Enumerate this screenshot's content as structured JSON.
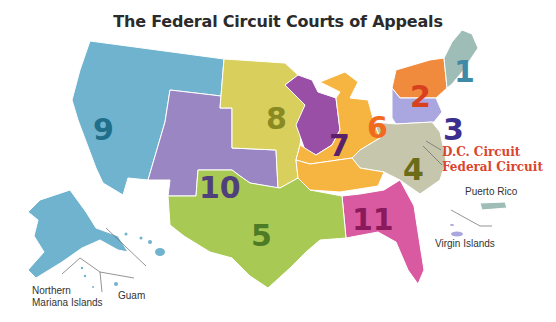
{
  "title": "The Federal Circuit Courts of Appeals",
  "circuits": [
    {
      "id": "1",
      "label": "1",
      "color": "#9fbdb7",
      "text_color": "#3f8aa6"
    },
    {
      "id": "2",
      "label": "2",
      "color": "#f08a3c",
      "text_color": "#d8411f"
    },
    {
      "id": "3",
      "label": "3",
      "color": "#a9a6e0",
      "text_color": "#3b2f8f"
    },
    {
      "id": "4",
      "label": "4",
      "color": "#c6c6ac",
      "text_color": "#6b6b18"
    },
    {
      "id": "5",
      "label": "5",
      "color": "#a9c955",
      "text_color": "#4e7b25"
    },
    {
      "id": "6",
      "label": "6",
      "color": "#f6b540",
      "text_color": "#f06b1e"
    },
    {
      "id": "7",
      "label": "7",
      "color": "#9a4fa6",
      "text_color": "#5a1f6d"
    },
    {
      "id": "8",
      "label": "8",
      "color": "#d8cf5c",
      "text_color": "#8a8a22"
    },
    {
      "id": "9",
      "label": "9",
      "color": "#6fb3cf",
      "text_color": "#1f6f8a"
    },
    {
      "id": "10",
      "label": "10",
      "color": "#9a86c2",
      "text_color": "#4f3f7a"
    },
    {
      "id": "11",
      "label": "11",
      "color": "#d95aa0",
      "text_color": "#8a1a5c"
    }
  ],
  "annotations": {
    "dc_circuit": "D.C. Circuit",
    "federal_circuit": "Federal Circuit",
    "puerto_rico": "Puerto Rico",
    "virgin_islands": "Virgin Islands",
    "northern_mariana_line1": "Northern",
    "northern_mariana_line2": "Mariana Islands",
    "guam": "Guam"
  }
}
